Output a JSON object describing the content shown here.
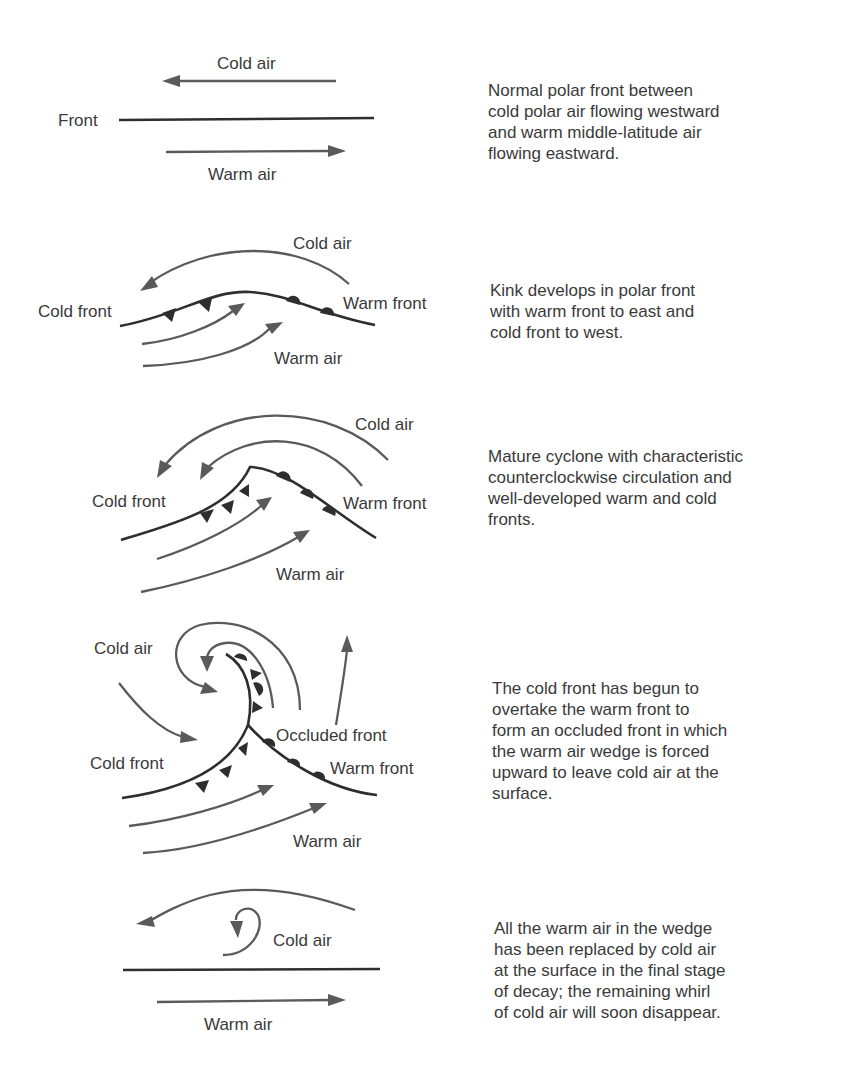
{
  "panels": [
    {
      "stage": 1,
      "labels": {
        "cold_air": "Cold air",
        "front": "Front",
        "warm_air": "Warm air"
      },
      "description": "Normal polar front between\ncold polar air flowing westward\nand warm middle-latitude air\nflowing eastward."
    },
    {
      "stage": 2,
      "labels": {
        "cold_air": "Cold air",
        "cold_front": "Cold front",
        "warm_front": "Warm front",
        "warm_air": "Warm air"
      },
      "description": "Kink develops in polar front\nwith warm front to east and\ncold front to west."
    },
    {
      "stage": 3,
      "labels": {
        "cold_air": "Cold air",
        "cold_front": "Cold front",
        "warm_front": "Warm front",
        "warm_air": "Warm air"
      },
      "description": "Mature cyclone with characteristic\ncounterclockwise circulation and\nwell-developed warm and cold\nfronts."
    },
    {
      "stage": 4,
      "labels": {
        "cold_air": "Cold air",
        "occluded_front": "Occluded front",
        "cold_front": "Cold front",
        "warm_front": "Warm front",
        "warm_air": "Warm air"
      },
      "description": "The cold front has begun to\novertake the warm front to\nform an occluded front in which\nthe warm air wedge is forced\nupward to leave cold air at the\nsurface."
    },
    {
      "stage": 5,
      "labels": {
        "cold_air": "Cold air",
        "warm_air": "Warm air"
      },
      "description": "All the warm air in the wedge\nhas been replaced by cold air\nat the surface in the final stage\nof decay; the remaining whirl\nof cold air will soon disappear."
    }
  ],
  "colors": {
    "front_line": "#2e2e2e",
    "flow_arrow": "#5a5a5a",
    "text": "#3a3a3a",
    "background": "#ffffff"
  }
}
